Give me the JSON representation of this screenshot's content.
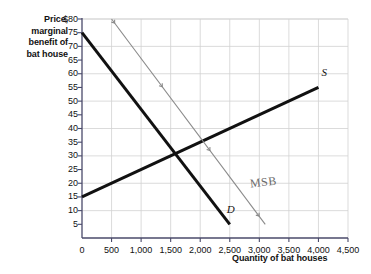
{
  "chart_data": {
    "type": "line",
    "title": "",
    "xlabel": "Quantity of bat houses",
    "ylabel": "Price, marginal benefit of bat house",
    "xlim": [
      0,
      4500
    ],
    "ylim": [
      0,
      80
    ],
    "grid": true,
    "legend_position": "inline-labels",
    "x_ticks": [
      "0",
      "500",
      "1,000",
      "1,500",
      "2,000",
      "2,500",
      "3,000",
      "3,500",
      "4,000",
      "4,500"
    ],
    "x_tick_values": [
      0,
      500,
      1000,
      1500,
      2000,
      2500,
      3000,
      3500,
      4000,
      4500
    ],
    "y_ticks": [
      "5",
      "10",
      "15",
      "20",
      "25",
      "30",
      "35",
      "40",
      "45",
      "50",
      "55",
      "60",
      "65",
      "70",
      "75",
      "$80"
    ],
    "y_tick_values": [
      5,
      10,
      15,
      20,
      25,
      30,
      35,
      40,
      45,
      50,
      55,
      60,
      65,
      70,
      75,
      80
    ],
    "series": [
      {
        "name": "D",
        "label": "D",
        "style": "thick-black",
        "color": "#111111",
        "points": [
          [
            0,
            75
          ],
          [
            2500,
            5
          ]
        ]
      },
      {
        "name": "S",
        "label": "S",
        "style": "thick-black",
        "color": "#111111",
        "points": [
          [
            0,
            15
          ],
          [
            4000,
            55
          ]
        ]
      },
      {
        "name": "MSB",
        "label": "MSB",
        "style": "thin-gray-annotated",
        "color": "#8a8a8a",
        "points": [
          [
            500,
            80
          ],
          [
            3100,
            5
          ]
        ]
      }
    ],
    "annotations": [
      {
        "text": "D",
        "x": 2450,
        "y": 10
      },
      {
        "text": "S",
        "x": 4050,
        "y": 60
      },
      {
        "text": "MSB",
        "x": 2850,
        "y": 20
      }
    ]
  },
  "axes": {
    "y_title_lines": [
      "Price,",
      "marginal",
      "benefit of",
      "bat house"
    ],
    "x_title": "Quantity of bat houses"
  },
  "labels": {
    "demand": "D",
    "supply": "S",
    "msb": "MSB"
  }
}
